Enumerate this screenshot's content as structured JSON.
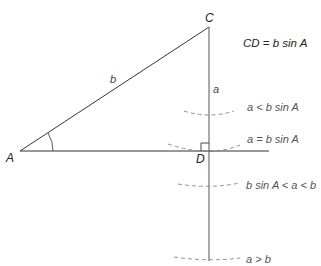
{
  "diagram": {
    "vertices": {
      "A": {
        "label": "A",
        "x": 20,
        "y": 151
      },
      "C": {
        "label": "C",
        "x": 209,
        "y": 27
      },
      "D": {
        "label": "D",
        "x": 209,
        "y": 151
      }
    },
    "sides": {
      "b": {
        "label": "b",
        "from": "A",
        "to": "C"
      },
      "a": {
        "label": "a",
        "from": "C",
        "along": "vertical line through C and D"
      }
    },
    "annotation": "CD = b sin A",
    "annotation_parts": {
      "lhs": "CD",
      "eq": " = ",
      "rhs": "b sin A"
    },
    "cases": [
      {
        "label": "a < b sin A",
        "arc_y": 115
      },
      {
        "label": "a = b sin A",
        "arc_y": 151
      },
      {
        "label": "b sin A < a < b",
        "arc_y": 186
      },
      {
        "label": "a > b",
        "arc_y": 259
      }
    ],
    "markers": {
      "angle_at_A": true,
      "right_angle_at_D": true
    },
    "colors": {
      "line": "#333333",
      "dashed": "#666666",
      "text": "#222222"
    }
  }
}
